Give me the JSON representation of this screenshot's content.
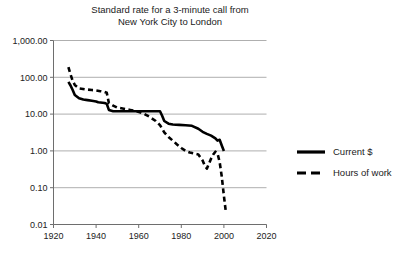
{
  "chart_data": {
    "type": "line",
    "title": "Standard rate for a 3-minute call from\nNew York City to London",
    "xlabel": "",
    "ylabel": "",
    "yscale": "log",
    "ylim": [
      0.01,
      1000
    ],
    "xlim": [
      1920,
      2020
    ],
    "grid": true,
    "legend_position": "right",
    "ytick_labels": [
      "1,000.00",
      "100.00",
      "10.00",
      "1.00",
      "0.10",
      "0.01"
    ],
    "ytick_values": [
      1000,
      100,
      10,
      1,
      0.1,
      0.01
    ],
    "xtick_labels": [
      "1920",
      "1940",
      "1960",
      "1980",
      "2000",
      "2020"
    ],
    "xtick_values": [
      1920,
      1940,
      1960,
      1980,
      2000,
      2020
    ],
    "series": [
      {
        "name": "Current $",
        "style": "solid",
        "color": "#000000",
        "x": [
          1927,
          1928,
          1929,
          1930,
          1932,
          1934,
          1936,
          1938,
          1940,
          1941,
          1944,
          1945,
          1946,
          1948,
          1950,
          1953,
          1956,
          1959,
          1962,
          1965,
          1968,
          1970,
          1971,
          1972,
          1974,
          1976,
          1979,
          1982,
          1985,
          1988,
          1990,
          1992,
          1994,
          1996,
          1997,
          1998,
          1999,
          2000
        ],
        "y": [
          75,
          60,
          45,
          33,
          27,
          25,
          24,
          23,
          22,
          21,
          20,
          19,
          13,
          12,
          12,
          12,
          12,
          12,
          12,
          12,
          12,
          12,
          9,
          6.5,
          5.5,
          5.2,
          5.1,
          5.0,
          4.8,
          4.0,
          3.3,
          2.9,
          2.6,
          2.2,
          1.9,
          2.0,
          1.4,
          1.0
        ]
      },
      {
        "name": "Hours of work",
        "style": "dashed",
        "color": "#000000",
        "x": [
          1927,
          1928,
          1929,
          1930,
          1932,
          1935,
          1938,
          1940,
          1942,
          1944,
          1945,
          1946,
          1948,
          1950,
          1953,
          1956,
          1959,
          1962,
          1965,
          1968,
          1970,
          1972,
          1974,
          1976,
          1978,
          1980,
          1982,
          1984,
          1986,
          1988,
          1990,
          1991,
          1992,
          1993,
          1994,
          1995,
          1996,
          1997,
          1998,
          1999,
          2000,
          2001
        ],
        "y": [
          190,
          120,
          80,
          62,
          50,
          47,
          45,
          44,
          42,
          40,
          38,
          20,
          17,
          15,
          14,
          13,
          12,
          10.5,
          8.5,
          6.5,
          5.0,
          3.2,
          2.4,
          1.9,
          1.5,
          1.2,
          1.0,
          0.9,
          0.85,
          0.8,
          0.55,
          0.4,
          0.33,
          0.45,
          0.62,
          0.8,
          0.95,
          0.85,
          0.5,
          0.2,
          0.06,
          0.02
        ]
      }
    ]
  },
  "legend": {
    "items": [
      {
        "label": "Current $",
        "style": "solid"
      },
      {
        "label": "Hours of work",
        "style": "dashed"
      }
    ]
  }
}
